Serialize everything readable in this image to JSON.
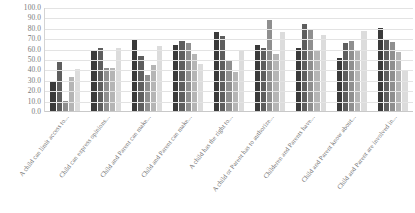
{
  "chart_data": {
    "type": "bar",
    "title": "",
    "subtitle": "",
    "xlabel": "",
    "ylabel": "",
    "ylim": [
      0.0,
      100.0
    ],
    "y_tick_step": 10.0,
    "grid": true,
    "legend": "none",
    "orientation": "vertical",
    "grouping": "clustered",
    "y_ticks": [
      "100.0",
      "90.0",
      "80.0",
      "70.0",
      "60.0",
      "50.0",
      "40.0",
      "30.0",
      "20.0",
      "10.0",
      "0.0"
    ],
    "y_tick_values": [
      100.0,
      90.0,
      80.0,
      70.0,
      60.0,
      50.0,
      40.0,
      30.0,
      20.0,
      10.0,
      0.0
    ],
    "categories": [
      "A child can limit access to...",
      "Child can express opinions...",
      "Child and Parent can make...",
      "Child and Parent can make...",
      "A child has the right to...",
      "A child or Parent has to authorize...",
      "Childeren and Parents have...",
      "Child and Parent know about...",
      "Child and Parent are involved in..."
    ],
    "series": [
      {
        "name": "Series 1",
        "color": "#3a3a3a",
        "values": [
          30.0,
          60.0,
          70.0,
          64.0,
          77.0,
          64.0,
          62.0,
          52.0,
          81.0
        ]
      },
      {
        "name": "Series 2",
        "color": "#5e5e5e",
        "values": [
          48.0,
          62.0,
          54.0,
          68.0,
          73.0,
          62.0,
          85.0,
          66.0,
          70.0
        ]
      },
      {
        "name": "Series 3",
        "color": "#8f8f8f",
        "values": [
          11.0,
          42.0,
          36.0,
          66.0,
          50.0,
          88.0,
          80.0,
          68.0,
          67.0
        ]
      },
      {
        "name": "Series 4",
        "color": "#b5b5b5",
        "values": [
          34.0,
          42.0,
          45.0,
          56.0,
          38.0,
          56.0,
          60.0,
          60.0,
          58.0
        ]
      },
      {
        "name": "Series 5",
        "color": "#dcdcdc",
        "values": [
          41.0,
          62.0,
          63.0,
          46.0,
          60.0,
          77.0,
          74.0,
          78.0,
          40.0
        ]
      }
    ]
  }
}
